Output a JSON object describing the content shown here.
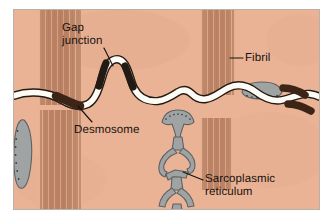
{
  "figure": {
    "kind": "histology-diagram",
    "frame": {
      "x": 13,
      "y": 9,
      "width": 307,
      "height": 201
    },
    "colors": {
      "page_background": "#ffffff",
      "cytoplasm": "#eab396",
      "cytoplasm_shadow": "#dca487",
      "fibril_line": "#8a5a3c",
      "membrane_fill": "#fdfbf6",
      "membrane_outline": "#241a12",
      "junction_dark": "#231a14",
      "desmosome_dark": "#3c2417",
      "sarcoplasmic_reticulum": "#9fa3a3",
      "sarcoplasmic_reticulum_outline": "#5d6161",
      "label_text": "#17120f",
      "leader_line": "#17120f",
      "frame_border": "#b9b0a8"
    }
  },
  "labels": [
    {
      "id": "gap-junction",
      "line1": "Gap",
      "line2": "junction",
      "leader": {
        "from_x": 104,
        "from_y": 48,
        "to_x": 113,
        "to_y": 66
      }
    },
    {
      "id": "desmosome",
      "line1": "Desmosome",
      "line2": "",
      "leader": {
        "from_x": 92,
        "from_y": 122,
        "to_x": 78,
        "to_y": 106
      }
    },
    {
      "id": "fibril",
      "line1": "Fibril",
      "line2": "",
      "leader": {
        "from_x": 243,
        "from_y": 58,
        "to_x": 230,
        "to_y": 58
      }
    },
    {
      "id": "sarcoplasmic-reticulum",
      "line1": "Sarcoplasmic",
      "line2": "reticulum",
      "leader": {
        "from_x": 203,
        "from_y": 180,
        "to_x": 183,
        "to_y": 172
      }
    }
  ],
  "structures": {
    "fibril_bundles": [
      {
        "id": "upper-left",
        "x": 38,
        "y": 9,
        "width": 44,
        "height": 96,
        "lines": 17
      },
      {
        "id": "lower-left",
        "x": 38,
        "y": 110,
        "width": 44,
        "height": 100,
        "lines": 17
      },
      {
        "id": "upper-right",
        "x": 200,
        "y": 9,
        "width": 36,
        "height": 86,
        "lines": 14
      },
      {
        "id": "lower-right",
        "x": 200,
        "y": 118,
        "width": 34,
        "height": 72,
        "lines": 13
      }
    ],
    "membrane": {
      "description": "Interdigitating sarcolemma of the intercalated disc, drawn as a white band with dark outlines crossing the field horizontally",
      "band_width": 6
    },
    "gap_junctions": [
      {
        "id": "fold-left-limb",
        "x": 104,
        "y": 62
      },
      {
        "id": "fold-right-limb",
        "x": 120,
        "y": 70
      }
    ],
    "desmosomes": [
      {
        "id": "left-desmosome",
        "x": 68,
        "y": 100
      },
      {
        "id": "right-desmosome-upper",
        "x": 288,
        "y": 92
      },
      {
        "id": "right-desmosome-lower",
        "x": 296,
        "y": 108
      }
    ],
    "sarcoplasmic_reticulum_elements": [
      {
        "id": "left-vesicle",
        "x": 18,
        "y": 122,
        "beaded_edge": true
      },
      {
        "id": "central-network",
        "x": 160,
        "y": 110,
        "beaded_edge": true
      },
      {
        "id": "right-cistern",
        "x": 245,
        "y": 86,
        "beaded_edge": true
      }
    ]
  }
}
